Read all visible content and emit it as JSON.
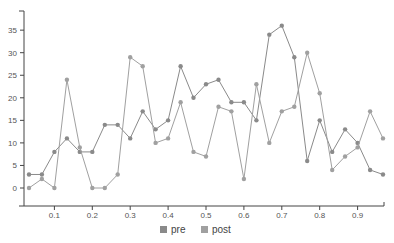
{
  "chart_data": {
    "type": "line",
    "title": "",
    "xlabel": "",
    "ylabel": "",
    "xlim": [
      0.0,
      1.0
    ],
    "ylim": [
      -4,
      39
    ],
    "x_ticks": [
      "0.1",
      "0.2",
      "0.3",
      "0.4",
      "0.5",
      "0.6",
      "0.7",
      "0.8",
      "0.9"
    ],
    "y_ticks": [
      "0",
      "5",
      "10",
      "15",
      "20",
      "25",
      "30",
      "35"
    ],
    "grid": false,
    "legend_position": "bottom-center",
    "x": [
      0.033,
      0.067,
      0.1,
      0.133,
      0.167,
      0.2,
      0.233,
      0.267,
      0.3,
      0.333,
      0.367,
      0.4,
      0.433,
      0.467,
      0.5,
      0.533,
      0.567,
      0.6,
      0.633,
      0.667,
      0.7,
      0.733,
      0.767,
      0.8,
      0.833,
      0.867,
      0.9,
      0.933,
      0.967
    ],
    "series": [
      {
        "name": "pre",
        "color": "#8a8a8a",
        "values": [
          3,
          3,
          8,
          11,
          8,
          8,
          14,
          14,
          11,
          17,
          13,
          15,
          27,
          20,
          23,
          24,
          19,
          19,
          15,
          34,
          36,
          29,
          6,
          15,
          8,
          13,
          10,
          4,
          3
        ]
      },
      {
        "name": "post",
        "color": "#a0a0a0",
        "values": [
          0,
          2,
          0,
          24,
          9,
          0,
          0,
          3,
          29,
          27,
          10,
          11,
          19,
          8,
          7,
          18,
          17,
          2,
          23,
          10,
          17,
          18,
          30,
          21,
          4,
          7,
          9,
          17,
          11
        ]
      }
    ]
  },
  "legend": {
    "items": [
      {
        "label": "pre",
        "color": "#8a8a8a"
      },
      {
        "label": "post",
        "color": "#a0a0a0"
      }
    ]
  }
}
